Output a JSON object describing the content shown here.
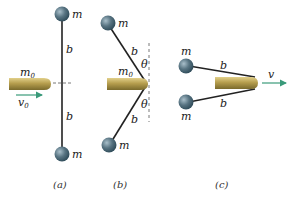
{
  "figure": {
    "panels": [
      {
        "id": "a",
        "caption": "(a)",
        "labels": {
          "top_mass": "m",
          "bottom_mass": "m",
          "upper_rod": "b",
          "lower_rod": "b",
          "bullet_mass": "m",
          "bullet_mass_sub": "0",
          "velocity": "v",
          "velocity_sub": "0"
        }
      },
      {
        "id": "b",
        "caption": "(b)",
        "labels": {
          "top_mass": "m",
          "bottom_mass": "m",
          "upper_rod": "b",
          "lower_rod": "b",
          "upper_angle": "θ",
          "lower_angle": "θ",
          "bullet_mass": "m",
          "bullet_mass_sub": "0"
        }
      },
      {
        "id": "c",
        "caption": "(c)",
        "labels": {
          "top_mass": "m",
          "bottom_mass": "m",
          "upper_rod": "b",
          "lower_rod": "b",
          "velocity": "v"
        }
      }
    ],
    "colors": {
      "sphere": "#4a6472",
      "sphere_highlight": "#9fb6c2",
      "bullet_dark": "#8a7a3a",
      "bullet_light": "#c9b56a",
      "rod": "#222222",
      "velocity_arrow": "#3a9a7a",
      "dashed_line": "#555555"
    }
  }
}
